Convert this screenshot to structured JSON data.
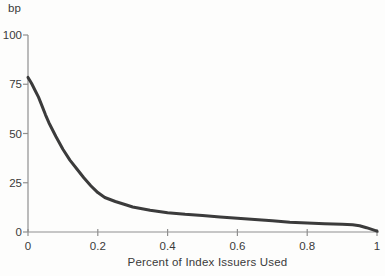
{
  "chart_data": {
    "type": "line",
    "title": "",
    "ylabel": "bp",
    "xlabel": "Percent of Index Issuers Used",
    "xlim": [
      0,
      1
    ],
    "ylim": [
      0,
      100
    ],
    "x_tick_values": [
      0,
      0.2,
      0.4,
      0.6,
      0.8,
      1
    ],
    "x_tick_labels": [
      "0",
      "0.2",
      "0.4",
      "0.6",
      "0.8",
      "1"
    ],
    "y_tick_values": [
      0,
      25,
      50,
      75,
      100
    ],
    "y_tick_labels": [
      "0",
      "25",
      "50",
      "75",
      "100"
    ],
    "grid": false,
    "legend": false,
    "line_color": "#3b3b3b",
    "axis_color": "#8f8f8f",
    "text_color": "#3a3a3a",
    "x": [
      0,
      0.005,
      0.01,
      0.02,
      0.03,
      0.04,
      0.05,
      0.06,
      0.08,
      0.1,
      0.12,
      0.14,
      0.16,
      0.18,
      0.2,
      0.22,
      0.25,
      0.28,
      0.3,
      0.35,
      0.4,
      0.45,
      0.5,
      0.55,
      0.6,
      0.65,
      0.7,
      0.75,
      0.8,
      0.85,
      0.9,
      0.93,
      0.95,
      0.97,
      1.0
    ],
    "y": [
      78.5,
      77,
      75.5,
      72,
      68.5,
      64,
      59.5,
      55.5,
      48.5,
      42,
      36.5,
      32,
      27.5,
      23.5,
      20,
      17.5,
      15.5,
      13.8,
      12.7,
      11,
      9.8,
      9,
      8.4,
      7.6,
      7,
      6.3,
      5.7,
      5,
      4.6,
      4.2,
      3.9,
      3.7,
      3.2,
      2.2,
      0.4
    ]
  }
}
